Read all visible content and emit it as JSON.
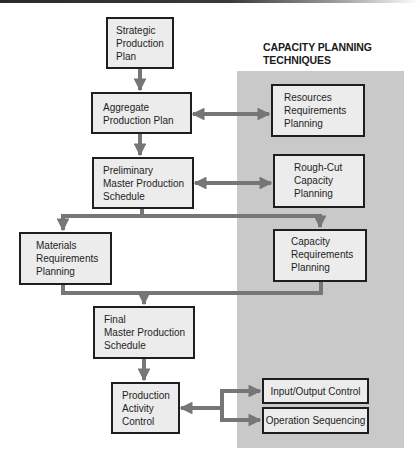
{
  "diagram": {
    "panel_title": [
      "CAPACITY PLANNING",
      "TECHNIQUES"
    ],
    "colors": {
      "arrow": "#767676",
      "box_fill": "#ececec",
      "box_border": "#1e1e1e",
      "panel": "#c9c9c9"
    },
    "nodes": {
      "strategic": [
        "Strategic",
        "Production",
        "Plan"
      ],
      "aggregate": [
        "Aggregate",
        "Production Plan"
      ],
      "preliminary_mps": [
        "Preliminary",
        "Master Production",
        "Schedule"
      ],
      "resources_rp": [
        "Resources",
        "Requirements",
        "Planning"
      ],
      "rough_cut": [
        "Rough-Cut",
        "Capacity",
        "Planning"
      ],
      "mrp": [
        "Materials",
        "Requirements",
        "Planning"
      ],
      "crp": [
        "Capacity",
        "Requirements",
        "Planning"
      ],
      "final_mps": [
        "Final",
        "Master Production",
        "Schedule"
      ],
      "pac": [
        "Production",
        "Activity",
        "Control"
      ],
      "io_control": "Input/Output Control",
      "op_sequencing": "Operation Sequencing"
    },
    "edges": [
      {
        "from": "Strategic Production Plan",
        "to": "Aggregate Production Plan"
      },
      {
        "from": "Aggregate Production Plan",
        "to": "Preliminary Master Production Schedule"
      },
      {
        "from": "Aggregate Production Plan",
        "to": "Resources Requirements Planning",
        "bidirectional": true
      },
      {
        "from": "Preliminary Master Production Schedule",
        "to": "Rough-Cut Capacity Planning",
        "bidirectional": true
      },
      {
        "from": "Preliminary Master Production Schedule",
        "to": "Materials Requirements Planning"
      },
      {
        "from": "Preliminary Master Production Schedule",
        "to": "Capacity Requirements Planning"
      },
      {
        "from": "Materials Requirements Planning",
        "to": "Final Master Production Schedule"
      },
      {
        "from": "Capacity Requirements Planning",
        "to": "Final Master Production Schedule"
      },
      {
        "from": "Final Master Production Schedule",
        "to": "Production Activity Control"
      },
      {
        "from": "Production Activity Control",
        "to": "Input/Output Control",
        "bidirectional": true
      },
      {
        "from": "Production Activity Control",
        "to": "Operation Sequencing",
        "bidirectional": true
      }
    ]
  }
}
